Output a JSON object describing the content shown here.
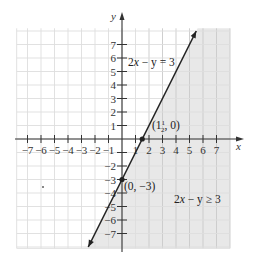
{
  "chart_data": {
    "type": "line",
    "title": "",
    "xlabel": "x",
    "ylabel": "y",
    "xlim": [
      -8,
      8
    ],
    "ylim": [
      -8,
      8
    ],
    "grid": true,
    "x_ticks": [
      -7,
      -6,
      -5,
      -4,
      -3,
      -2,
      -1,
      1,
      2,
      3,
      4,
      5,
      6,
      7
    ],
    "y_ticks": [
      7,
      6,
      5,
      4,
      3,
      2,
      1,
      -2,
      -3,
      -4,
      -5,
      -6,
      -7
    ],
    "x_tick_labels": [
      "−7",
      "−6",
      "−5",
      "−4",
      "−3",
      "−2",
      "−1",
      "1",
      "2",
      "3",
      "4",
      "5",
      "6",
      "7"
    ],
    "y_tick_labels": [
      "7",
      "6",
      "5",
      "4",
      "3",
      "2",
      "1",
      "−2",
      "−3",
      "−4",
      "−5",
      "−6",
      "−7"
    ],
    "series": [
      {
        "name": "2x − y = 3",
        "equation": "y = 2x - 3",
        "x": [
          -2.5,
          5.5
        ],
        "y": [
          -8,
          8
        ],
        "style": "solid line with arrows at both ends"
      }
    ],
    "points": [
      {
        "label": "(1½, 0)",
        "x": 1.5,
        "y": 0
      },
      {
        "label": "(0, −3)",
        "x": 0,
        "y": -3
      }
    ],
    "shaded_region": {
      "inequality": "2x − y ≥ 3",
      "side": "right/below the line",
      "color": "#e8e8e8"
    },
    "annotations": [
      {
        "text": "2x − y = 3",
        "x": 0.3,
        "y": 5.5
      },
      {
        "text": "(1½, 0)",
        "x": 1.6,
        "y": 0.7
      },
      {
        "text": "(0, −3)",
        "x": 0.1,
        "y": -3.6
      },
      {
        "text": "2x − y ≥ 3",
        "x": 3.8,
        "y": -5
      }
    ]
  },
  "labels": {
    "x_axis": "x",
    "y_axis": "y",
    "line_equation_prefix": "2",
    "line_equation_var": "x",
    "line_equation_suffix": " − y = 3",
    "inequality_prefix": "2",
    "inequality_var": "x",
    "inequality_suffix": " − y ≥ 3",
    "point1_open": "(1",
    "point1_num": "1",
    "point1_den": "2",
    "point1_close": ", 0)",
    "point2": "(0, −3)"
  },
  "colors": {
    "shade": "#e8e8e8",
    "grid_light": "#dedede",
    "grid_shaded": "#c9c9c9",
    "axis": "#333333",
    "line": "#222222"
  }
}
